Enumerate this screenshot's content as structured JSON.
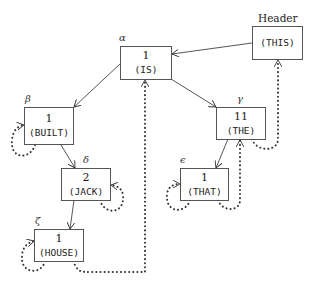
{
  "diagram": {
    "header_label": "Header",
    "header_word": "(THIS)",
    "nodes": {
      "alpha": {
        "label": "α",
        "count": "1",
        "word": "(IS)"
      },
      "beta": {
        "label": "β",
        "count": "1",
        "word": "(BUILT)"
      },
      "gamma": {
        "label": "γ",
        "count": "11",
        "word": "(THE)"
      },
      "delta": {
        "label": "δ",
        "count": "2",
        "word": "(JACK)"
      },
      "epsilon": {
        "label": "ϵ",
        "count": "1",
        "word": "(THAT)"
      },
      "zeta": {
        "label": "ζ",
        "count": "1",
        "word": "(HOUSE)"
      }
    },
    "edges_solid": [
      [
        "header",
        "alpha"
      ],
      [
        "alpha",
        "beta"
      ],
      [
        "alpha",
        "gamma"
      ],
      [
        "beta",
        "delta"
      ],
      [
        "delta",
        "zeta"
      ],
      [
        "gamma",
        "epsilon"
      ]
    ],
    "edges_dotted": [
      [
        "beta",
        "beta"
      ],
      [
        "delta",
        "delta"
      ],
      [
        "zeta",
        "zeta"
      ],
      [
        "epsilon",
        "epsilon"
      ],
      [
        "zeta",
        "alpha"
      ],
      [
        "epsilon",
        "gamma"
      ],
      [
        "gamma",
        "header"
      ]
    ]
  }
}
